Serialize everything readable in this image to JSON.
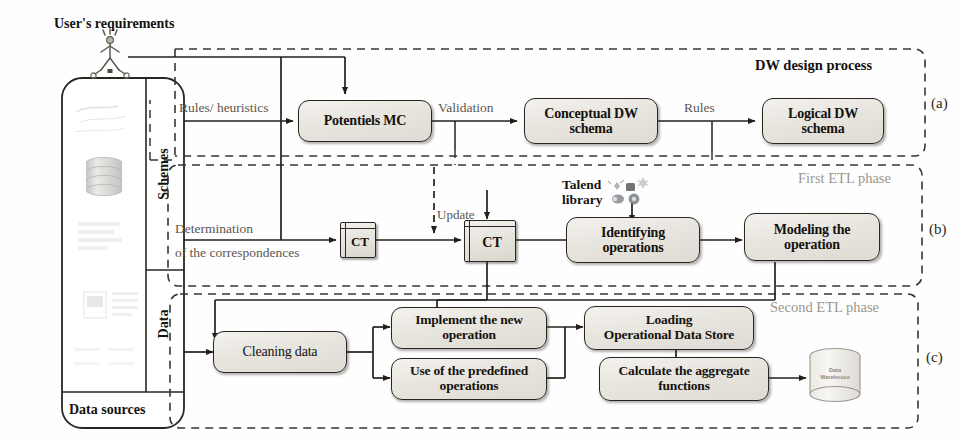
{
  "figure": {
    "user_requirements_label": "User's requirements",
    "source_panel": {
      "schemes_label": "Schemes",
      "data_label": "Data",
      "footer_label": "Data sources"
    },
    "regions": [
      {
        "id": "a",
        "title": "DW design process",
        "tag": "(a)"
      },
      {
        "id": "b",
        "title": "First ETL phase",
        "tag": "(b)"
      },
      {
        "id": "c",
        "title": "Second ETL phase",
        "tag": "(c)"
      }
    ],
    "nodes": [
      {
        "id": "potentiels_mc",
        "label": "Potentiels MC"
      },
      {
        "id": "conceptual_dw_schema",
        "label": "Conceptual DW\nschema"
      },
      {
        "id": "logical_dw_schema",
        "label": "Logical DW\nschema"
      },
      {
        "id": "ct1",
        "label": "CT"
      },
      {
        "id": "ct2",
        "label": "CT"
      },
      {
        "id": "identifying_operations",
        "label": "Identifying\noperations"
      },
      {
        "id": "modeling_the_operation",
        "label": "Modeling the\noperation"
      },
      {
        "id": "cleaning_data",
        "label": "Cleaning data"
      },
      {
        "id": "implement_new_operation",
        "label": "Implement the new\noperation"
      },
      {
        "id": "use_predefined_operations",
        "label": "Use of the predefined\noperations"
      },
      {
        "id": "loading_operational_data_store",
        "label": "Loading\nOperational Data Store"
      },
      {
        "id": "calculate_aggregate_functions",
        "label": "Calculate the aggregate\nfunctions"
      },
      {
        "id": "data_warehouse",
        "label": "Data\nWarehouse"
      }
    ],
    "edge_labels": [
      {
        "id": "rules_heuristics",
        "label": "Rules/ heuristics"
      },
      {
        "id": "validation",
        "label": "Validation"
      },
      {
        "id": "rules",
        "label": "Rules"
      },
      {
        "id": "update",
        "label": "Update"
      },
      {
        "id": "determination_line1",
        "label": "Determination"
      },
      {
        "id": "determination_line2",
        "label": "of the correspondences"
      },
      {
        "id": "talend_line1",
        "label": "Talend"
      },
      {
        "id": "talend_line2",
        "label": "library"
      }
    ],
    "colors": {
      "ink": "#15120e",
      "line": "#2a2520",
      "faint_text": "#9c968d",
      "label_text": "#3b3631",
      "box_fill": "#e8e5df",
      "dash_border": "#3a352f"
    }
  }
}
